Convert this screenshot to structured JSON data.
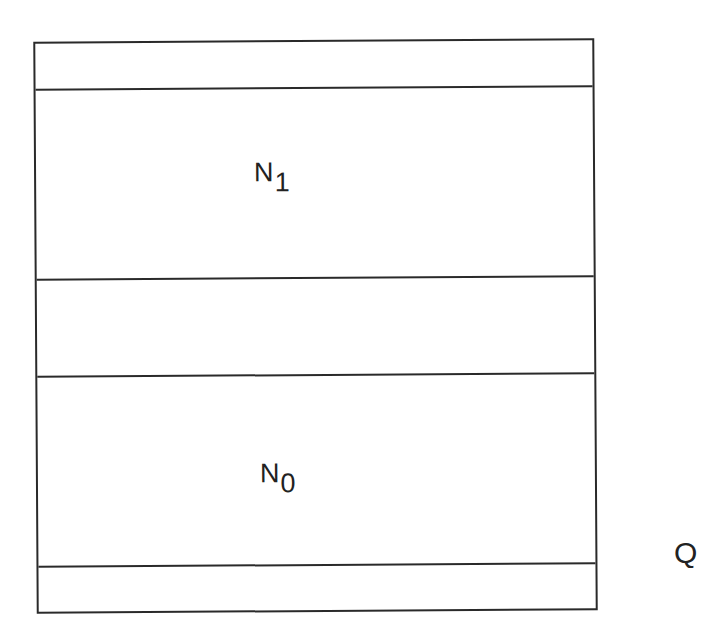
{
  "diagram": {
    "bands": [
      {
        "name": "top-thin-band",
        "label": ""
      },
      {
        "name": "n1-band",
        "label": "N",
        "subscript": "1"
      },
      {
        "name": "middle-gap-band",
        "label": ""
      },
      {
        "name": "n0-band",
        "label": "N",
        "subscript": "0"
      },
      {
        "name": "bottom-thin-band",
        "label": ""
      }
    ],
    "side_label": "Q"
  }
}
